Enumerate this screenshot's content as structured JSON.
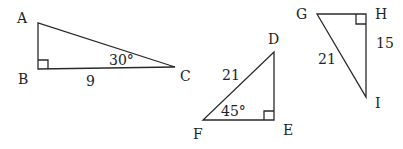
{
  "diagram": {
    "colors": {
      "line": "#2a2a2a",
      "text": "#222222",
      "background": "#ffffff"
    },
    "triangles": [
      {
        "name": "ABC",
        "vertices": {
          "A": "A",
          "B": "B",
          "C": "C"
        },
        "right_angle_at": "B",
        "side_label": "9",
        "side_label_on": "BC",
        "angle_label": "30°",
        "angle_at": "C"
      },
      {
        "name": "DEF",
        "vertices": {
          "D": "D",
          "E": "E",
          "F": "F"
        },
        "right_angle_at": "E",
        "side_label": "21",
        "side_label_on": "DF",
        "angle_label": "45°",
        "angle_at": "F"
      },
      {
        "name": "GHI",
        "vertices": {
          "G": "G",
          "H": "H",
          "I": "I"
        },
        "right_angle_at": "H",
        "side_labels": [
          "21",
          "15"
        ],
        "side_labels_on": [
          "GI",
          "HI"
        ]
      }
    ]
  }
}
